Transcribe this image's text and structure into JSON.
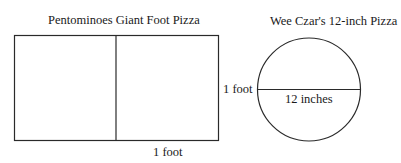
{
  "left_figure": {
    "title": "Pentominoes Giant Foot Pizza",
    "side_label": "1 foot",
    "bottom_label": "1 foot",
    "shape": "rectangle-divided-in-half"
  },
  "right_figure": {
    "title": "Wee Czar's 12-inch Pizza",
    "diameter_label": "12 inches",
    "shape": "circle-with-diameter"
  }
}
